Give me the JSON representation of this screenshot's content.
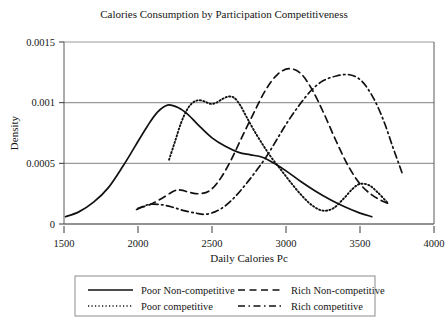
{
  "chart_data": {
    "type": "line",
    "title": "Calories Consumption by Participation Competitiveness",
    "xlabel": "Daily Calories Pc",
    "ylabel": "Density",
    "xlim": [
      1500,
      4000
    ],
    "ylim": [
      0,
      0.0015
    ],
    "xticks": [
      "1500",
      "2000",
      "2500",
      "3000",
      "3500",
      "4000"
    ],
    "yticks": [
      "0",
      "0.0005",
      "0.001",
      "0.0015"
    ],
    "grid": "horizontal",
    "legend_position": "below-axes",
    "series": [
      {
        "name": "Poor Non-competitive",
        "style": "solid",
        "points": [
          [
            1510,
            6e-05
          ],
          [
            1600,
            0.0001
          ],
          [
            1700,
            0.00018
          ],
          [
            1800,
            0.0003
          ],
          [
            1900,
            0.00048
          ],
          [
            1980,
            0.00064
          ],
          [
            2060,
            0.0008
          ],
          [
            2130,
            0.00092
          ],
          [
            2200,
            0.00098
          ],
          [
            2270,
            0.00096
          ],
          [
            2340,
            0.0009
          ],
          [
            2420,
            0.0008
          ],
          [
            2500,
            0.00071
          ],
          [
            2590,
            0.00064
          ],
          [
            2680,
            0.00059
          ],
          [
            2760,
            0.00057
          ],
          [
            2840,
            0.00055
          ],
          [
            2920,
            0.0005
          ],
          [
            3010,
            0.00043
          ],
          [
            3100,
            0.00035
          ],
          [
            3200,
            0.00027
          ],
          [
            3300,
            0.0002
          ],
          [
            3400,
            0.00014
          ],
          [
            3500,
            9e-05
          ],
          [
            3580,
            6e-05
          ]
        ]
      },
      {
        "name": "Rich Non-competitive",
        "style": "dashed",
        "points": [
          [
            2000,
            0.00013
          ],
          [
            2080,
            0.00016
          ],
          [
            2160,
            0.00021
          ],
          [
            2240,
            0.00027
          ],
          [
            2290,
            0.00028
          ],
          [
            2350,
            0.00026
          ],
          [
            2420,
            0.00025
          ],
          [
            2490,
            0.00028
          ],
          [
            2560,
            0.00038
          ],
          [
            2630,
            0.00053
          ],
          [
            2700,
            0.00071
          ],
          [
            2780,
            0.00091
          ],
          [
            2860,
            0.0011
          ],
          [
            2940,
            0.00123
          ],
          [
            3020,
            0.00128
          ],
          [
            3100,
            0.00124
          ],
          [
            3180,
            0.0011
          ],
          [
            3260,
            0.0009
          ],
          [
            3340,
            0.00068
          ],
          [
            3420,
            0.00048
          ],
          [
            3500,
            0.00033
          ],
          [
            3580,
            0.00024
          ],
          [
            3650,
            0.00019
          ],
          [
            3710,
            0.00016
          ]
        ]
      },
      {
        "name": "Poor competitive",
        "style": "dotted",
        "points": [
          [
            2210,
            0.00053
          ],
          [
            2250,
            0.00068
          ],
          [
            2290,
            0.00083
          ],
          [
            2330,
            0.00094
          ],
          [
            2370,
            0.001
          ],
          [
            2410,
            0.00102
          ],
          [
            2450,
            0.00101
          ],
          [
            2490,
            0.00099
          ],
          [
            2530,
            0.001
          ],
          [
            2570,
            0.00103
          ],
          [
            2610,
            0.00105
          ],
          [
            2650,
            0.00104
          ],
          [
            2690,
            0.00098
          ],
          [
            2730,
            0.00089
          ],
          [
            2780,
            0.00078
          ],
          [
            2840,
            0.00066
          ],
          [
            2900,
            0.00055
          ],
          [
            2970,
            0.00044
          ],
          [
            3040,
            0.00033
          ],
          [
            3110,
            0.00023
          ],
          [
            3180,
            0.00015
          ],
          [
            3250,
            0.00011
          ],
          [
            3320,
            0.00013
          ],
          [
            3390,
            0.00021
          ],
          [
            3450,
            0.00029
          ],
          [
            3500,
            0.00033
          ],
          [
            3560,
            0.00032
          ],
          [
            3620,
            0.00026
          ],
          [
            3690,
            0.00017
          ]
        ]
      },
      {
        "name": "Rich competitive",
        "style": "dashdot",
        "points": [
          [
            1990,
            0.00012
          ],
          [
            2070,
            0.00016
          ],
          [
            2150,
            0.00016
          ],
          [
            2230,
            0.00014
          ],
          [
            2310,
            0.00011
          ],
          [
            2390,
            9e-05
          ],
          [
            2450,
            8e-05
          ],
          [
            2520,
            0.0001
          ],
          [
            2590,
            0.00015
          ],
          [
            2660,
            0.00023
          ],
          [
            2730,
            0.00033
          ],
          [
            2800,
            0.00044
          ],
          [
            2870,
            0.00056
          ],
          [
            2940,
            0.0007
          ],
          [
            3010,
            0.00084
          ],
          [
            3090,
            0.00098
          ],
          [
            3170,
            0.0011
          ],
          [
            3250,
            0.00118
          ],
          [
            3340,
            0.00122
          ],
          [
            3430,
            0.00123
          ],
          [
            3510,
            0.00118
          ],
          [
            3590,
            0.00104
          ],
          [
            3660,
            0.00085
          ],
          [
            3720,
            0.00064
          ],
          [
            3770,
            0.00047
          ],
          [
            3790,
            0.0004
          ]
        ]
      }
    ]
  },
  "legend": {
    "entries": [
      {
        "label": "Poor Non-competitive",
        "style": "solid"
      },
      {
        "label": "Rich Non-competitive",
        "style": "dashed"
      },
      {
        "label": "Poor competitive",
        "style": "dotted"
      },
      {
        "label": "Rich competitive",
        "style": "dashdot"
      }
    ]
  }
}
